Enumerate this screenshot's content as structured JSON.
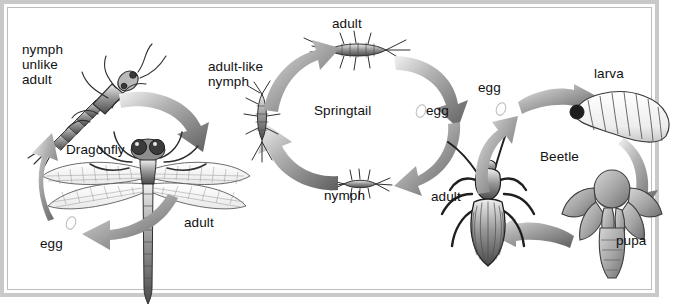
{
  "figure": {
    "background_color": "#ffffff",
    "frame_color": "#c9c9c9",
    "ink_color": "#111111",
    "arrow_color": "#6e6e6e"
  },
  "cycles": [
    {
      "id": "dragonfly",
      "name": "Dragonfly",
      "metamorphosis": "incomplete",
      "stages": [
        {
          "key": "nymph",
          "label": "nymph\nunlike\nadult"
        },
        {
          "key": "adult",
          "label": "adult"
        },
        {
          "key": "egg",
          "label": "egg"
        }
      ],
      "arrows": 3
    },
    {
      "id": "springtail",
      "name": "Springtail",
      "metamorphosis": "none (ametabolous)",
      "stages": [
        {
          "key": "adult",
          "label": "adult"
        },
        {
          "key": "egg",
          "label": "egg"
        },
        {
          "key": "nymph",
          "label": "nymph"
        },
        {
          "key": "adult-like-nymph",
          "label": "adult-like\nnymph"
        }
      ],
      "arrows": 4
    },
    {
      "id": "beetle",
      "name": "Beetle",
      "metamorphosis": "complete",
      "stages": [
        {
          "key": "egg",
          "label": "egg"
        },
        {
          "key": "larva",
          "label": "larva"
        },
        {
          "key": "pupa",
          "label": "pupa"
        },
        {
          "key": "adult",
          "label": "adult"
        }
      ],
      "arrows": 4
    }
  ],
  "labels": {
    "dragonfly_name": "Dragonfly",
    "dragonfly_nymph": "nymph\nunlike\nadult",
    "dragonfly_adult": "adult",
    "dragonfly_egg": "egg",
    "springtail_name": "Springtail",
    "springtail_adult": "adult",
    "springtail_egg": "egg",
    "springtail_nymph": "nymph",
    "springtail_adult_like_nymph": "adult-like\nnymph",
    "beetle_name": "Beetle",
    "beetle_egg": "egg",
    "beetle_larva": "larva",
    "beetle_pupa": "pupa",
    "beetle_adult": "adult"
  }
}
